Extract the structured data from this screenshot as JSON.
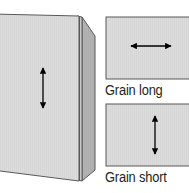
{
  "figure": {
    "colors": {
      "panel_front": "#dcdcdc",
      "panel_inner": "#d2d2d2",
      "panel_back": "#b4b4b4",
      "swatch_fill": "#dcdcdc",
      "outline": "#58595b",
      "arrow": "#000000",
      "text": "#231f20",
      "background": "#ffffff"
    }
  },
  "folded_card": {
    "name": "folded card perspective view",
    "grain_arrow": {
      "name": "vertical double arrow",
      "direction": "vertical",
      "meaning": "grain runs parallel to the fold"
    }
  },
  "swatches": [
    {
      "label": "Grain long",
      "arrow_direction": "horizontal",
      "arrow_name": "horizontal double arrow"
    },
    {
      "label": "Grain short",
      "arrow_direction": "vertical",
      "arrow_name": "vertical double arrow"
    }
  ]
}
